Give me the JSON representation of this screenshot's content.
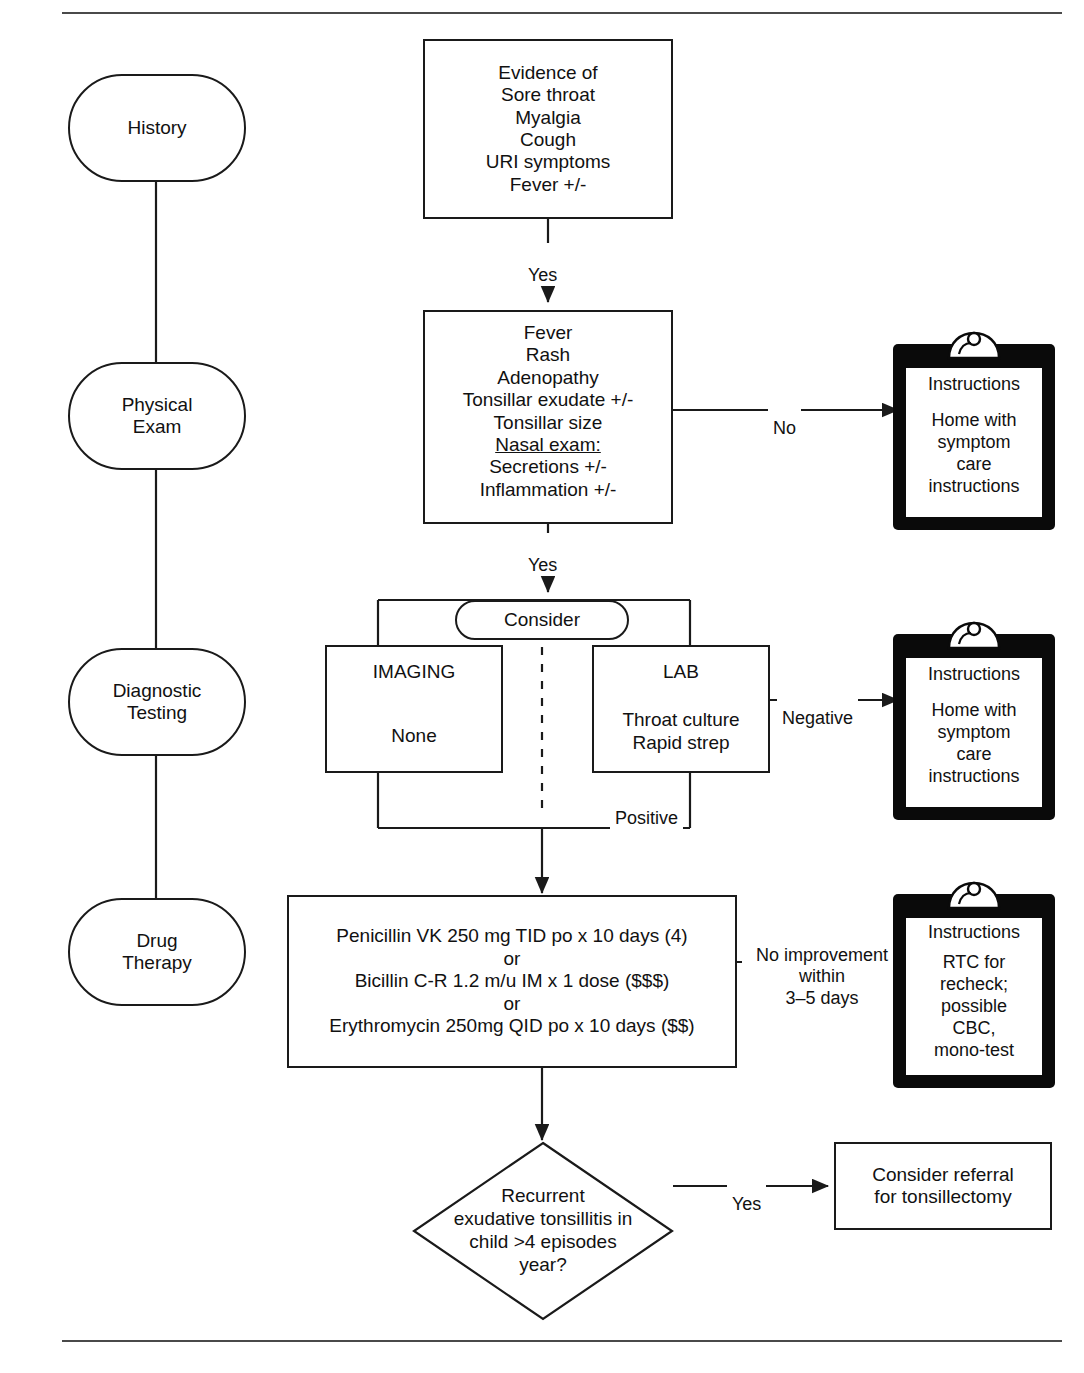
{
  "diagram": {
    "type": "clinical-algorithm-flowchart",
    "topic": "Pharyngitis / Sore throat evaluation and management"
  },
  "stages": [
    {
      "id": "history",
      "label": "History"
    },
    {
      "id": "physical-exam",
      "label": "Physical\nExam"
    },
    {
      "id": "diagnostic-testing",
      "label": "Diagnostic\nTesting"
    },
    {
      "id": "drug-therapy",
      "label": "Drug\nTherapy"
    }
  ],
  "nodes": {
    "history_box": {
      "text": "Evidence of\nSore throat\nMyalgia\nCough\nURI symptoms\nFever +/-"
    },
    "exam_box": {
      "line1": "Fever",
      "line2": "Rash",
      "line3": "Adenopathy",
      "line4": "Tonsillar exudate +/-",
      "line5": "Tonsillar size",
      "line6_underlined": "Nasal exam:",
      "line7": "Secretions +/-",
      "line8": "Inflammation +/-"
    },
    "consider_pill": {
      "label": "Consider"
    },
    "imaging_box": {
      "title": "IMAGING",
      "body": "None"
    },
    "lab_box": {
      "title": "LAB",
      "body": "Throat culture\nRapid strep"
    },
    "drug_box": {
      "text": "Penicillin VK 250 mg TID po x 10 days (4)\nor\nBicillin C-R 1.2 m/u IM x 1 dose ($$$)\nor\nErythromycin 250mg QID po x 10 days ($$)"
    },
    "decision_diamond": {
      "text": "Recurrent\nexudative tonsillitis in\nchild >4 episodes\nyear?"
    },
    "referral_box": {
      "text": "Consider referral\nfor tonsillectomy"
    }
  },
  "clipboards": [
    {
      "id": "clipboard-exam-no",
      "title": "Instructions",
      "body": "Home with\nsymptom\ncare\ninstructions"
    },
    {
      "id": "clipboard-lab-negative",
      "title": "Instructions",
      "body": "Home with\nsymptom\ncare\ninstructions"
    },
    {
      "id": "clipboard-no-improvement",
      "title": "Instructions",
      "body": "RTC for\nrecheck;\npossible\nCBC,\nmono-test"
    }
  ],
  "edge_labels": {
    "history_yes": "Yes",
    "exam_yes": "Yes",
    "exam_no": "No",
    "lab_negative": "Negative",
    "lab_positive": "Positive",
    "no_improvement": "No improvement\nwithin\n3–5 days",
    "decision_yes": "Yes"
  },
  "colors": {
    "stroke": "#1a1a1a",
    "clipboard_body": "#0a0a0a",
    "paper": "#ffffff",
    "page_background": "#ffffff",
    "rule": "#4a4a4a"
  }
}
